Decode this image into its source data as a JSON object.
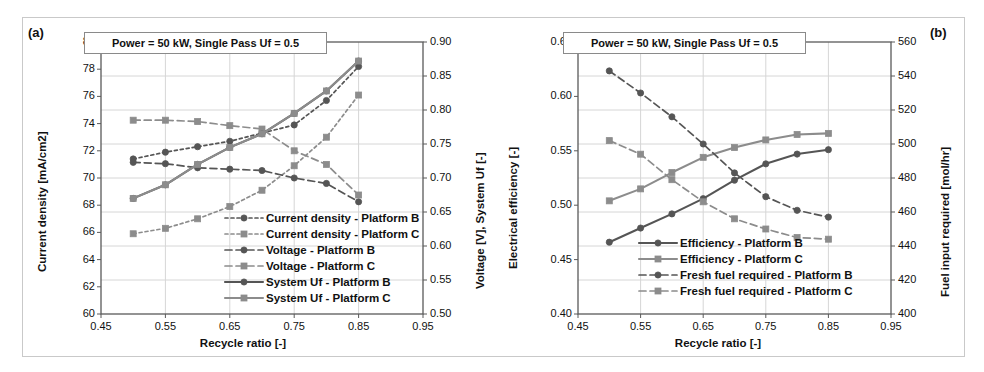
{
  "figure": {
    "panels": [
      "(a)",
      "(b)"
    ],
    "annotation": "Power = 50 kW, Single Pass Uf = 0.5",
    "xlabel": "Recycle ratio [-]"
  },
  "panel_a": {
    "tag": "(a)",
    "annotation": "Power = 50 kW, Single Pass Uf = 0.5",
    "ylabel_left": "Current density [mA/cm2]",
    "ylabel_right": "Voltage [V], System Uf [-]",
    "xlabel": "Recycle ratio [-]",
    "xticks": [
      "0.45",
      "0.55",
      "0.65",
      "0.75",
      "0.85",
      "0.95"
    ],
    "yticks_left": [
      "60",
      "62",
      "64",
      "66",
      "68",
      "70",
      "72",
      "74",
      "76",
      "78",
      "80"
    ],
    "yticks_right": [
      "0.50",
      "0.55",
      "0.60",
      "0.65",
      "0.70",
      "0.75",
      "0.80",
      "0.85",
      "0.90"
    ],
    "legend": [
      "Current density - Platform B",
      "Current density - Platform C",
      "Voltage - Platform B",
      "Voltage - Platform C",
      "System Uf - Platform B",
      "System Uf - Platform C"
    ]
  },
  "panel_b": {
    "tag": "(b)",
    "annotation": "Power = 50 kW, Single Pass Uf = 0.5",
    "ylabel_left": "Electrical efficiency [-]",
    "ylabel_right": "Fuel input required [mol/hr]",
    "xlabel": "Recycle ratio [-]",
    "xticks": [
      "0.45",
      "0.55",
      "0.65",
      "0.75",
      "0.85",
      "0.95"
    ],
    "yticks_left": [
      "0.40",
      "0.45",
      "0.50",
      "0.55",
      "0.60",
      "0.65"
    ],
    "yticks_right": [
      "400",
      "420",
      "440",
      "460",
      "480",
      "500",
      "520",
      "540",
      "560"
    ],
    "legend": [
      "Efficiency - Platform B",
      "Efficiency - Platform C",
      "Fresh fuel required - Platform B",
      "Fresh fuel required - Platform C"
    ]
  },
  "colors": {
    "platform_b": "#555555",
    "platform_c": "#8c8c8c",
    "axis": "#5a5a5a",
    "grid": "#d6d6d6",
    "text": "#111111",
    "frame": "#c9c9c9"
  },
  "chart_data": [
    {
      "type": "line",
      "panel": "(a)",
      "title": "Power = 50 kW, Single Pass Uf = 0.5",
      "xlabel": "Recycle ratio [-]",
      "ylabel": "Current density [mA/cm2]",
      "ylabel_right": "Voltage [V], System Uf [-]",
      "xlim": [
        0.45,
        0.95
      ],
      "ylim": [
        60,
        80
      ],
      "ylim_right": [
        0.5,
        0.9
      ],
      "xticks": [
        0.45,
        0.55,
        0.65,
        0.75,
        0.85,
        0.95
      ],
      "yticks": [
        60,
        62,
        64,
        66,
        68,
        70,
        72,
        74,
        76,
        78,
        80
      ],
      "yticks_right": [
        0.5,
        0.55,
        0.6,
        0.65,
        0.7,
        0.75,
        0.8,
        0.85,
        0.9
      ],
      "grid": true,
      "legend_position": "lower-right-inside",
      "x": [
        0.5,
        0.55,
        0.6,
        0.65,
        0.7,
        0.75,
        0.8,
        0.85
      ],
      "series": [
        {
          "name": "Current density - Platform B",
          "axis": "left",
          "marker": "circle",
          "linestyle": "dotted",
          "color": "#555555",
          "values": [
            71.4,
            71.9,
            72.3,
            72.7,
            73.3,
            73.9,
            75.7,
            78.2
          ]
        },
        {
          "name": "Current density - Platform C",
          "axis": "left",
          "marker": "square",
          "linestyle": "dotted",
          "color": "#8c8c8c",
          "values": [
            65.9,
            66.3,
            67.0,
            67.9,
            69.1,
            70.9,
            73.0,
            76.1
          ]
        },
        {
          "name": "Voltage - Platform B",
          "axis": "right",
          "marker": "circle",
          "linestyle": "dashed",
          "color": "#555555",
          "values": [
            0.723,
            0.721,
            0.715,
            0.713,
            0.711,
            0.7,
            0.692,
            0.665
          ]
        },
        {
          "name": "Voltage - Platform C",
          "axis": "right",
          "marker": "square",
          "linestyle": "dashed",
          "color": "#8c8c8c",
          "values": [
            0.785,
            0.785,
            0.783,
            0.777,
            0.772,
            0.74,
            0.72,
            0.675
          ]
        },
        {
          "name": "System Uf - Platform B",
          "axis": "right",
          "marker": "circle",
          "linestyle": "solid",
          "color": "#555555",
          "values": [
            0.67,
            0.69,
            0.72,
            0.745,
            0.765,
            0.795,
            0.828,
            0.872
          ]
        },
        {
          "name": "System Uf - Platform C",
          "axis": "right",
          "marker": "square",
          "linestyle": "solid",
          "color": "#8c8c8c",
          "values": [
            0.67,
            0.69,
            0.72,
            0.745,
            0.765,
            0.795,
            0.828,
            0.872
          ]
        }
      ]
    },
    {
      "type": "line",
      "panel": "(b)",
      "title": "Power = 50 kW, Single Pass Uf = 0.5",
      "xlabel": "Recycle ratio [-]",
      "ylabel": "Electrical efficiency [-]",
      "ylabel_right": "Fuel input required [mol/hr]",
      "xlim": [
        0.45,
        0.95
      ],
      "ylim": [
        0.4,
        0.65
      ],
      "ylim_right": [
        400,
        560
      ],
      "xticks": [
        0.45,
        0.55,
        0.65,
        0.75,
        0.85,
        0.95
      ],
      "yticks": [
        0.4,
        0.45,
        0.5,
        0.55,
        0.6,
        0.65
      ],
      "yticks_right": [
        400,
        420,
        440,
        460,
        480,
        500,
        520,
        540,
        560
      ],
      "grid": true,
      "legend_position": "lower-center-inside",
      "x": [
        0.5,
        0.55,
        0.6,
        0.65,
        0.7,
        0.75,
        0.8,
        0.85
      ],
      "series": [
        {
          "name": "Efficiency - Platform B",
          "axis": "left",
          "marker": "circle",
          "linestyle": "solid",
          "color": "#555555",
          "values": [
            0.466,
            0.479,
            0.492,
            0.506,
            0.523,
            0.538,
            0.547,
            0.551
          ]
        },
        {
          "name": "Efficiency - Platform C",
          "axis": "left",
          "marker": "square",
          "linestyle": "solid",
          "color": "#8c8c8c",
          "values": [
            0.504,
            0.515,
            0.53,
            0.544,
            0.553,
            0.56,
            0.565,
            0.566
          ]
        },
        {
          "name": "Fresh fuel required - Platform B",
          "axis": "right",
          "marker": "circle",
          "linestyle": "dashed",
          "color": "#555555",
          "values": [
            543,
            530,
            516,
            500,
            483,
            469,
            461,
            457
          ]
        },
        {
          "name": "Fresh fuel required - Platform C",
          "axis": "right",
          "marker": "square",
          "linestyle": "dashed",
          "color": "#8c8c8c",
          "values": [
            502,
            494,
            479,
            466,
            456,
            450,
            445,
            444
          ]
        }
      ]
    }
  ]
}
